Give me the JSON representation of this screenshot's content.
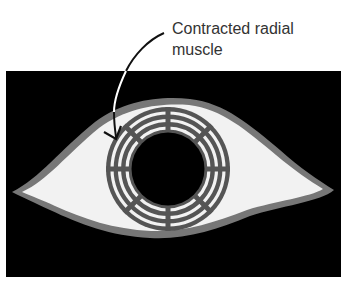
{
  "figure": {
    "labels": {
      "main_line1": "Contracted radial",
      "main_line2": "muscle",
      "cropped_fragment": "r"
    },
    "colors": {
      "background_panel": "#000000",
      "eye_outline": "#777777",
      "sclera": "#f2f2f2",
      "iris_muscle": "#555555",
      "iris_gap": "#f2f2f2",
      "pupil": "#000000",
      "arrow_on_white": "#111111",
      "arrow_on_black": "#ffffff",
      "text": "#333333"
    },
    "iris": {
      "center": [
        168,
        169
      ],
      "outer_radius": 62,
      "pupil_radius": 36,
      "gap_ring_radii": [
        56,
        48,
        41
      ],
      "spoke_count": 8
    }
  }
}
